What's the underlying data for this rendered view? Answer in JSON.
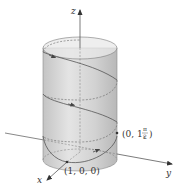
{
  "figure": {
    "axes": {
      "x_label": "x",
      "y_label": "y",
      "z_label": "z"
    },
    "points": [
      {
        "id": "p1",
        "label": "(1, 0, 0)"
      },
      {
        "id": "p2",
        "label_prefix": "(0, 1, ",
        "label_frac_num": "π",
        "label_frac_den": "2",
        "label_suffix": ")"
      }
    ],
    "colors": {
      "cylinder_fill": "#d6d6d6",
      "cylinder_top": "#e6e6e6",
      "axis": "#444444",
      "helix": "#555555",
      "background": "#ffffff"
    }
  }
}
